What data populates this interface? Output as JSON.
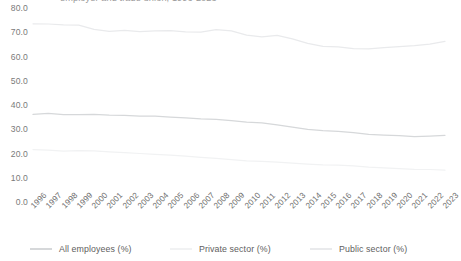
{
  "chart_data": {
    "type": "line",
    "title": "employer and trade union, 1996-2023",
    "xlabel": "",
    "ylabel": "",
    "ylim": [
      0,
      80
    ],
    "ytick_labels": [
      "80.0",
      "70.0",
      "60.0",
      "50.0",
      "40.0",
      "30.0",
      "20.0",
      "10.0",
      "0.0"
    ],
    "ytick_values": [
      80,
      70,
      60,
      50,
      40,
      30,
      20,
      10,
      0
    ],
    "grid": false,
    "legend_position": "bottom",
    "categories": [
      "1996",
      "1997",
      "1998",
      "1999",
      "2000",
      "2001",
      "2002",
      "2003",
      "2004",
      "2005",
      "2006",
      "2007",
      "2008",
      "2009",
      "2010",
      "2011",
      "2012",
      "2013",
      "2014",
      "2015",
      "2016",
      "2017",
      "2018",
      "2019",
      "2020",
      "2021",
      "2022",
      "2023"
    ],
    "series": [
      {
        "name": "Public sector (%)",
        "color": "#e9eaec",
        "values": [
          73.5,
          73.4,
          73.0,
          72.9,
          71.2,
          70.4,
          70.8,
          70.3,
          70.6,
          70.7,
          70.2,
          70.1,
          71.1,
          70.6,
          68.8,
          68.1,
          68.7,
          67.3,
          65.4,
          64.2,
          64.0,
          63.2,
          63.1,
          63.7,
          64.1,
          64.5,
          65.1,
          66.2
        ]
      },
      {
        "name": "All employees (%)",
        "color": "#d6d8da",
        "values": [
          36.1,
          36.5,
          36.0,
          36.0,
          36.1,
          35.8,
          35.7,
          35.4,
          35.4,
          35.0,
          34.7,
          34.3,
          34.1,
          33.6,
          32.9,
          32.6,
          31.8,
          30.9,
          29.9,
          29.4,
          29.1,
          28.6,
          27.9,
          27.6,
          27.4,
          27.0,
          27.2,
          27.5
        ]
      },
      {
        "name": "Private sector (%)",
        "color": "#f1f2f3",
        "values": [
          21.6,
          21.4,
          21.0,
          21.2,
          21.1,
          20.7,
          20.4,
          20.0,
          19.6,
          19.3,
          18.9,
          18.4,
          18.0,
          17.5,
          17.0,
          16.8,
          16.4,
          16.0,
          15.6,
          15.3,
          15.2,
          14.9,
          14.4,
          14.1,
          13.8,
          13.5,
          13.4,
          13.1
        ]
      }
    ]
  },
  "legend": {
    "items": [
      {
        "label": "All employees (%)"
      },
      {
        "label": "Private sector (%)"
      },
      {
        "label": "Public sector (%)"
      }
    ]
  }
}
